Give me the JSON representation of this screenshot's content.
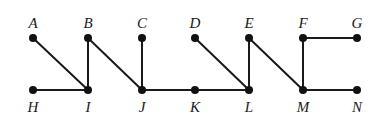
{
  "graph": {
    "nodes": [
      {
        "id": "A",
        "label": "A",
        "x": 33,
        "y": 38,
        "label_pos": "top"
      },
      {
        "id": "B",
        "label": "B",
        "x": 88,
        "y": 38,
        "label_pos": "top"
      },
      {
        "id": "C",
        "label": "C",
        "x": 142,
        "y": 38,
        "label_pos": "top"
      },
      {
        "id": "D",
        "label": "D",
        "x": 195,
        "y": 38,
        "label_pos": "top"
      },
      {
        "id": "E",
        "label": "E",
        "x": 249,
        "y": 38,
        "label_pos": "top"
      },
      {
        "id": "F",
        "label": "F",
        "x": 303,
        "y": 38,
        "label_pos": "top"
      },
      {
        "id": "G",
        "label": "G",
        "x": 357,
        "y": 38,
        "label_pos": "top"
      },
      {
        "id": "H",
        "label": "H",
        "x": 33,
        "y": 90,
        "label_pos": "bottom"
      },
      {
        "id": "I",
        "label": "I",
        "x": 88,
        "y": 90,
        "label_pos": "bottom"
      },
      {
        "id": "J",
        "label": "J",
        "x": 142,
        "y": 90,
        "label_pos": "bottom"
      },
      {
        "id": "K",
        "label": "K",
        "x": 195,
        "y": 90,
        "label_pos": "bottom"
      },
      {
        "id": "L",
        "label": "L",
        "x": 249,
        "y": 90,
        "label_pos": "bottom"
      },
      {
        "id": "M",
        "label": "M",
        "x": 303,
        "y": 90,
        "label_pos": "bottom"
      },
      {
        "id": "N",
        "label": "N",
        "x": 357,
        "y": 90,
        "label_pos": "bottom"
      }
    ],
    "edges": [
      [
        "A",
        "I"
      ],
      [
        "H",
        "I"
      ],
      [
        "B",
        "I"
      ],
      [
        "B",
        "J"
      ],
      [
        "C",
        "J"
      ],
      [
        "J",
        "K"
      ],
      [
        "K",
        "L"
      ],
      [
        "D",
        "L"
      ],
      [
        "E",
        "L"
      ],
      [
        "E",
        "M"
      ],
      [
        "F",
        "M"
      ],
      [
        "F",
        "G"
      ],
      [
        "M",
        "N"
      ]
    ],
    "colors": {
      "stroke": "#1a1a1a",
      "node": "#111111",
      "background": "#ffffff"
    }
  }
}
